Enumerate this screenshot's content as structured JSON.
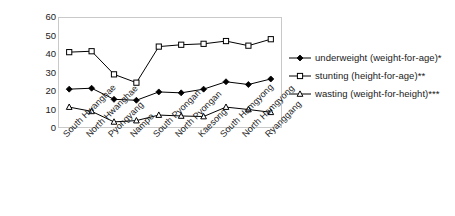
{
  "chart_data": {
    "type": "line",
    "title": "",
    "subtitle": "",
    "xlabel": "",
    "ylabel": "prevalence in percent",
    "ylim": [
      0,
      60
    ],
    "ytick_labels": [
      "60",
      "50",
      "40",
      "30",
      "20",
      "10",
      "0"
    ],
    "ytick_values": [
      60,
      50,
      40,
      30,
      20,
      10,
      0
    ],
    "grid": false,
    "legend_position": "right",
    "categories": [
      "South Hwanghae",
      "North Hwanghae",
      "Pyongyang",
      "Nampo",
      "South Pyongan",
      "North Pyongan",
      "Kaesong",
      "South Hamgyong",
      "North Hamgyong",
      "Ryanggang"
    ],
    "series": [
      {
        "name": "underweight (weight-for-age)*",
        "marker": "filled-diamond",
        "color": "#000000",
        "values": [
          21,
          21.5,
          15.5,
          15,
          19.5,
          19,
          21,
          25,
          23.5,
          26.5
        ]
      },
      {
        "name": "stunting (height-for-age)**",
        "marker": "open-square",
        "color": "#000000",
        "values": [
          41,
          41.5,
          29,
          24.5,
          44,
          45,
          45.5,
          47,
          44.5,
          48
        ]
      },
      {
        "name": "wasting (weight-for-height)***",
        "marker": "open-triangle",
        "color": "#000000",
        "values": [
          11.3,
          9,
          3.3,
          4,
          7,
          6.5,
          6.2,
          11.3,
          10,
          8.5
        ]
      }
    ]
  },
  "legend": {
    "items": [
      {
        "label": "underweight (weight-for-age)*"
      },
      {
        "label": "stunting (height-for-age)**"
      },
      {
        "label": "wasting (weight-for-height)***"
      }
    ]
  }
}
